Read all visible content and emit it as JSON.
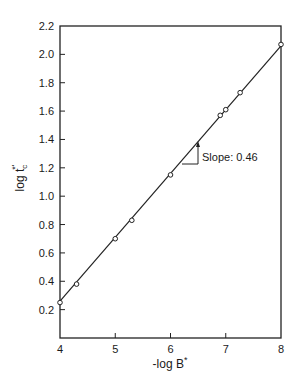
{
  "chart_data": {
    "type": "scatter",
    "title": "",
    "xlabel": "-log B*",
    "ylabel": "log t_c*'",
    "xlim": [
      4,
      8
    ],
    "ylim": [
      0,
      2.2
    ],
    "xticks": [
      4,
      5,
      6,
      7,
      8
    ],
    "yticks": [
      0.2,
      0.4,
      0.6,
      0.8,
      1.0,
      1.2,
      1.4,
      1.6,
      1.8,
      2.0,
      2.2
    ],
    "ytick_labels": [
      "0.2",
      "0.4",
      "0.6",
      "0.8",
      "1.0",
      "1.2",
      "1.4",
      "1.6",
      "1.8",
      "2.0",
      "2.2"
    ],
    "xtick_labels": [
      "4",
      "5",
      "6",
      "7",
      "8"
    ],
    "grid": false,
    "legend": null,
    "series": [
      {
        "name": "data",
        "marker": "open-circle",
        "x": [
          4.0,
          4.3,
          5.0,
          5.3,
          6.0,
          6.9,
          7.0,
          7.26,
          8.0
        ],
        "y": [
          0.25,
          0.38,
          0.7,
          0.83,
          1.15,
          1.57,
          1.61,
          1.73,
          2.07
        ]
      },
      {
        "name": "fit",
        "style": "line",
        "x": [
          4.0,
          8.0
        ],
        "y": [
          0.26,
          2.06
        ]
      }
    ],
    "annotations": [
      {
        "text": "Slope: 0.46",
        "x": 6.5,
        "y": 1.26
      }
    ]
  },
  "labels": {
    "xlabel": "-log B",
    "xlabel_sup": "*",
    "ylabel_main": "log t",
    "ylabel_sub": "c",
    "ylabel_sup": "*'",
    "slope_text": "Slope: 0.46"
  }
}
